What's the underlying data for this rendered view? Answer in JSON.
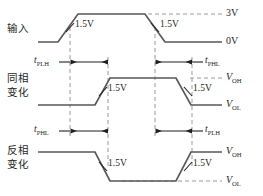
{
  "diagram": {
    "colors": {
      "waveform": "#58585a",
      "dashed": "#9a9a9c",
      "text": "#231f20",
      "background": "#ffffff"
    },
    "rows": [
      {
        "id": "input",
        "label": "输入",
        "label_lines": [
          "输入"
        ],
        "high_label": "3V",
        "low_label": "0V",
        "mid_markers": [
          "1.5V",
          "1.5V"
        ]
      },
      {
        "id": "noninverting",
        "label": "同相变化",
        "label_lines": [
          "同相",
          "变化"
        ],
        "high_label": "V_OH",
        "low_label": "V_OL",
        "mid_markers": [
          "1.5V",
          "1.5V"
        ]
      },
      {
        "id": "inverting",
        "label": "反相变化",
        "label_lines": [
          "反相",
          "变化"
        ],
        "high_label": "V_OH",
        "low_label": "V_OL",
        "mid_markers": [
          "1.5V",
          "1.5V"
        ]
      }
    ],
    "voltage_labels": {
      "three_volt": "3V",
      "zero_volt": "0V",
      "v_oh_base": "V",
      "v_oh_sub": "OH",
      "v_ol_base": "V",
      "v_ol_sub": "OL",
      "threshold": "1.5V"
    },
    "timing_markers": [
      {
        "id": "t1",
        "base": "t",
        "sub": "PLH",
        "row": "between-input-and-noninverting",
        "side": "left"
      },
      {
        "id": "t2",
        "base": "t",
        "sub": "PHL",
        "row": "between-input-and-noninverting",
        "side": "right"
      },
      {
        "id": "t3",
        "base": "t",
        "sub": "PHL",
        "row": "between-noninverting-and-inverting",
        "side": "left"
      },
      {
        "id": "t4",
        "base": "t",
        "sub": "PLH",
        "row": "between-noninverting-and-inverting",
        "side": "right"
      }
    ]
  }
}
